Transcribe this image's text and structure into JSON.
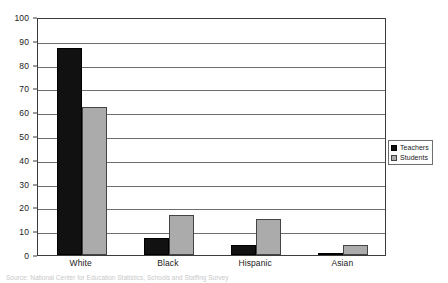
{
  "chart_data": {
    "type": "bar",
    "title": "",
    "subtitle": "",
    "xlabel": "",
    "ylabel": "",
    "categories": [
      "White",
      "Black",
      "Hispanic",
      "Asian"
    ],
    "series": [
      {
        "name": "Teachers",
        "color": "#111111",
        "values": [
          87,
          7,
          4,
          1
        ]
      },
      {
        "name": "Students",
        "color": "#ababab",
        "values": [
          62,
          17,
          15,
          4
        ]
      }
    ],
    "ylim": [
      0,
      100
    ],
    "ytick_step": 10,
    "ytick_labels": [
      "100",
      "90",
      "80",
      "70",
      "60",
      "50",
      "40",
      "30",
      "20",
      "10",
      "0"
    ],
    "grid": true,
    "grid_axis": "y",
    "legend_position": "right",
    "legend_entries": [
      "Teachers",
      "Students"
    ]
  },
  "legend": {
    "items": [
      {
        "label": "Teachers"
      },
      {
        "label": "Students"
      }
    ]
  },
  "footer": {
    "source_note": "Source: National Center for Education Statistics, Schools and Staffing Survey"
  }
}
